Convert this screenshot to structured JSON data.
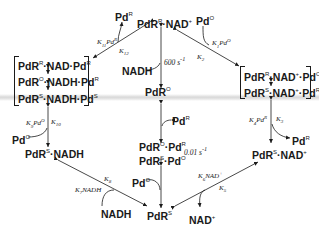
{
  "diagram": {
    "type": "catalytic-cycle",
    "center_top": {
      "species": "PdR",
      "sup": "R",
      "dot": "·",
      "partner": "NAD",
      "partner_sup": "+"
    },
    "center_mid": {
      "species": "PdR",
      "sup": "O"
    },
    "center_complex": {
      "line1": {
        "a": "PdR",
        "a_sup": "O",
        "b": "Pd",
        "b_sup": "R"
      },
      "line2": {
        "a": "PdR",
        "a_sup": "S",
        "b": "Pd",
        "b_sup": "O"
      }
    },
    "bottom": {
      "species": "PdR",
      "sup": "S"
    },
    "left_bracket": [
      {
        "a": "PdR",
        "a_sup": "R",
        "b": "NAD·Pd",
        "b_sup": "R"
      },
      {
        "a": "PdR",
        "a_sup": "O",
        "b": "NADH·Pd",
        "b_sup": "R"
      },
      {
        "a": "PdR",
        "a_sup": "S",
        "b": "NADH·Pd",
        "b_sup": "S"
      }
    ],
    "right_bracket": [
      {
        "a": "PdR",
        "a_sup": "R",
        "b": "NAD",
        "b_sup": "+",
        "c": "Pd",
        "c_sup": "O"
      },
      {
        "a": "PdR",
        "a_sup": "S",
        "b": "NAD",
        "b_sup": "+",
        "c": "Pd",
        "c_sup": "R"
      }
    ],
    "left_lower": {
      "species": "PdR",
      "sup": "S",
      "partner": "NADH"
    },
    "right_lower": {
      "species": "PdR",
      "sup": "S",
      "partner": "NAD",
      "partner_sup": "+"
    },
    "reagents": {
      "pd_r_top": {
        "t": "Pd",
        "s": "R"
      },
      "pd_o_top": {
        "t": "Pd",
        "s": "O"
      },
      "nadh_center": "NADH",
      "pd_r_center": {
        "t": "Pd",
        "s": "R"
      },
      "pd_o_left": {
        "t": "Pd",
        "s": "O"
      },
      "pd_o_bottom": {
        "t": "Pd",
        "s": "O"
      },
      "pd_r_right": {
        "t": "Pd",
        "s": "R"
      },
      "nadh_bottom": "NADH",
      "nad_bottom": {
        "t": "NAD",
        "s": "+"
      }
    },
    "rate_constants": {
      "k11": "K11Pd^R",
      "k12": "K12",
      "k1": "K1Pd^O",
      "k2": "K2",
      "k9": "K9Pd^O",
      "k10": "K10",
      "k4": "K4Pd^R",
      "k3": "K3",
      "k7": "K7NADH",
      "k8": "K8",
      "k6": "K6NAD^+",
      "k5": "K5"
    },
    "rates": {
      "fast": "600 s",
      "fast_exp": "-1",
      "slow": "0.01 s",
      "slow_exp": "-1"
    }
  }
}
